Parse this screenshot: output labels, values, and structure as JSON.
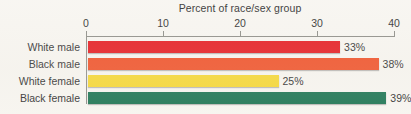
{
  "chart_data": {
    "type": "bar",
    "orientation": "horizontal",
    "title": "Percent of race/sex group",
    "xlabel": "Percent of race/sex group",
    "ylabel": "",
    "xlim": [
      0,
      40
    ],
    "ticks": [
      "0",
      "10",
      "20",
      "30",
      "40"
    ],
    "tick_values": [
      0,
      10,
      20,
      30,
      40
    ],
    "grid": false,
    "legend": "none",
    "categories": [
      "White male",
      "Black male",
      "White female",
      "Black female"
    ],
    "values": [
      33,
      38,
      25,
      39
    ],
    "value_labels": [
      "33%",
      "38%",
      "25%",
      "39%"
    ],
    "colors": [
      "#e4141a",
      "#ef4a20",
      "#f5d62e",
      "#17714f"
    ],
    "bars": [
      {
        "label": "White male",
        "value": 33,
        "value_label": "33%",
        "color": "#e4141a"
      },
      {
        "label": "Black male",
        "value": 38,
        "value_label": "38%",
        "color": "#ef4a20"
      },
      {
        "label": "White female",
        "value": 25,
        "value_label": "25%",
        "color": "#f5d62e"
      },
      {
        "label": "Black female",
        "value": 39,
        "value_label": "39%",
        "color": "#17714f"
      }
    ]
  },
  "style": {
    "background": "#f7f5f0",
    "axis_color": "#8a8a84",
    "text_color": "#2b2b2b"
  }
}
